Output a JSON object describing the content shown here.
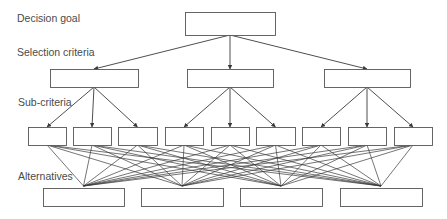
{
  "levels": {
    "goal": "Decision goal",
    "criteria": "Selection criteria",
    "subcriteria": "Sub-criteria",
    "alternatives": "Alternatives"
  },
  "colors": {
    "line": "#3a3a3a",
    "box_stroke": "#555555",
    "box_fill": "#ffffff",
    "text": "#4a4a4a"
  },
  "nodes": {
    "goal": {
      "x": 185,
      "y": 12,
      "w": 90,
      "h": 23
    },
    "criteria": [
      {
        "x": 50,
        "y": 69,
        "w": 88,
        "h": 18
      },
      {
        "x": 187,
        "y": 69,
        "w": 86,
        "h": 18
      },
      {
        "x": 324,
        "y": 69,
        "w": 86,
        "h": 18
      }
    ],
    "subcriteria": [
      {
        "x": 28,
        "y": 127,
        "w": 38,
        "h": 18,
        "parent": 0
      },
      {
        "x": 73,
        "y": 127,
        "w": 38,
        "h": 18,
        "parent": 0
      },
      {
        "x": 118,
        "y": 127,
        "w": 39,
        "h": 18,
        "parent": 0
      },
      {
        "x": 165,
        "y": 127,
        "w": 38,
        "h": 18,
        "parent": 1
      },
      {
        "x": 211,
        "y": 127,
        "w": 38,
        "h": 18,
        "parent": 1
      },
      {
        "x": 256,
        "y": 127,
        "w": 39,
        "h": 18,
        "parent": 1
      },
      {
        "x": 302,
        "y": 127,
        "w": 38,
        "h": 18,
        "parent": 2
      },
      {
        "x": 348,
        "y": 127,
        "w": 38,
        "h": 18,
        "parent": 2
      },
      {
        "x": 394,
        "y": 127,
        "w": 38,
        "h": 18,
        "parent": 2
      }
    ],
    "alternatives": [
      {
        "x": 43,
        "y": 188,
        "w": 81,
        "h": 18
      },
      {
        "x": 141,
        "y": 188,
        "w": 82,
        "h": 18
      },
      {
        "x": 240,
        "y": 188,
        "w": 82,
        "h": 18
      },
      {
        "x": 340,
        "y": 188,
        "w": 82,
        "h": 18
      }
    ]
  }
}
